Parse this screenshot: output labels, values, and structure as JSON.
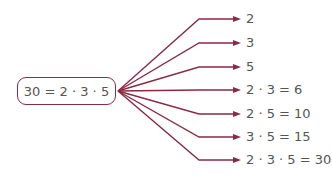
{
  "source": {
    "label": "30 = 2 · 3 · 5"
  },
  "colors": {
    "line": "#8b2a45",
    "text": "#555555"
  },
  "divisors": [
    {
      "label": "2",
      "y": 19
    },
    {
      "label": "3",
      "y": 43
    },
    {
      "label": "5",
      "y": 67
    },
    {
      "label": "2 · 3 = 6",
      "y": 90
    },
    {
      "label": "2 · 5 = 10",
      "y": 114
    },
    {
      "label": "3 · 5 = 15",
      "y": 137
    },
    {
      "label": "2 · 3 · 5 = 30",
      "y": 160
    }
  ]
}
